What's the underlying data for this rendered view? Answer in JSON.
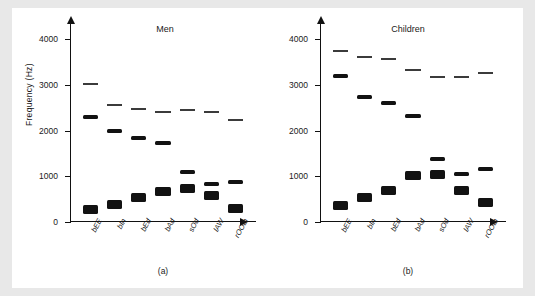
{
  "figure": {
    "ylabel": "Frequency (Hz)",
    "yticks": [
      0,
      1000,
      2000,
      3000,
      4000
    ],
    "ylim": [
      0,
      4200
    ],
    "categories": [
      "bEE",
      "bIn",
      "bEd",
      "bAd",
      "sOd",
      "lAW",
      "rOOth"
    ]
  },
  "chart_data": [
    {
      "type": "bar",
      "title": "Men",
      "caption": "(a)",
      "xlabel": "",
      "ylabel": "Frequency (Hz)",
      "ylim": [
        0,
        4200
      ],
      "yticks": [
        0,
        1000,
        2000,
        3000,
        4000
      ],
      "categories": [
        "bEE",
        "bIn",
        "bEd",
        "bAd",
        "sOd",
        "lAW",
        "rOOth"
      ],
      "series": [
        {
          "name": "F1",
          "values": [
            270,
            390,
            530,
            660,
            730,
            570,
            300
          ]
        },
        {
          "name": "F2",
          "values": [
            2290,
            1990,
            1840,
            1720,
            1090,
            840,
            870
          ]
        },
        {
          "name": "F3",
          "values": [
            3010,
            2550,
            2480,
            2410,
            2440,
            2410,
            2240
          ]
        }
      ]
    },
    {
      "type": "bar",
      "title": "Children",
      "caption": "(b)",
      "xlabel": "",
      "ylabel": "Frequency (Hz)",
      "ylim": [
        0,
        4200
      ],
      "yticks": [
        0,
        1000,
        2000,
        3000,
        4000
      ],
      "categories": [
        "bEE",
        "bIn",
        "bEd",
        "bAd",
        "sOd",
        "lAW",
        "rOOth"
      ],
      "series": [
        {
          "name": "F1",
          "values": [
            370,
            530,
            690,
            1010,
            1030,
            680,
            430
          ]
        },
        {
          "name": "F2",
          "values": [
            3200,
            2730,
            2610,
            2320,
            1370,
            1060,
            1170
          ]
        },
        {
          "name": "F3",
          "values": [
            3730,
            3600,
            3570,
            3320,
            3170,
            3180,
            3260
          ]
        }
      ]
    }
  ]
}
